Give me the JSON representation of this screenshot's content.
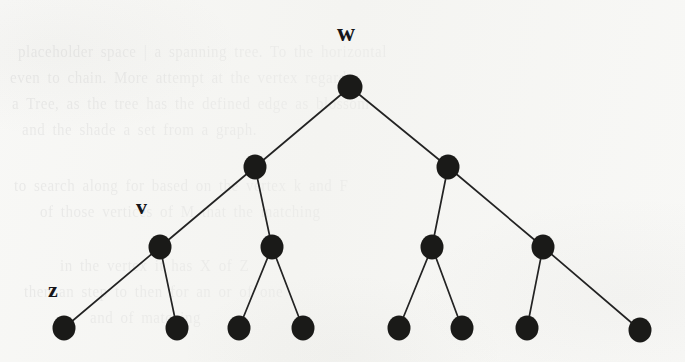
{
  "figure": {
    "kind": "binary-tree-diagram",
    "background_color": "#f8f8f6",
    "node_color": "#1a1a18",
    "edge_color": "#232323",
    "label_color": "#16161a",
    "width": 685,
    "height": 362
  },
  "labels": [
    {
      "id": "label-w",
      "text": "w",
      "x": 337,
      "y": 20,
      "font_size": 25,
      "anchor_node": "n-root"
    },
    {
      "id": "label-v",
      "text": "v",
      "x": 136,
      "y": 196,
      "font_size": 22,
      "anchor_node": "n-l-l"
    },
    {
      "id": "label-z",
      "text": "z",
      "x": 48,
      "y": 279,
      "font_size": 22,
      "anchor_node": "n-leaf-1"
    }
  ],
  "nodes": [
    {
      "id": "n-root",
      "label": "w",
      "level": 0,
      "cx": 350,
      "cy": 87,
      "rx": 12.5,
      "ry": 12.5
    },
    {
      "id": "n-l",
      "label": "",
      "level": 1,
      "cx": 255,
      "cy": 167,
      "rx": 11.5,
      "ry": 12.5
    },
    {
      "id": "n-r",
      "label": "",
      "level": 1,
      "cx": 448,
      "cy": 167,
      "rx": 11.5,
      "ry": 12.5
    },
    {
      "id": "n-l-l",
      "label": "v",
      "level": 2,
      "cx": 160,
      "cy": 247,
      "rx": 11.5,
      "ry": 12.5
    },
    {
      "id": "n-l-r",
      "label": "",
      "level": 2,
      "cx": 272,
      "cy": 247,
      "rx": 11.5,
      "ry": 12.5
    },
    {
      "id": "n-r-l",
      "label": "",
      "level": 2,
      "cx": 432,
      "cy": 247,
      "rx": 11.5,
      "ry": 12.5
    },
    {
      "id": "n-r-r",
      "label": "",
      "level": 2,
      "cx": 543,
      "cy": 247,
      "rx": 11.5,
      "ry": 12.5
    },
    {
      "id": "n-leaf-1",
      "label": "z",
      "level": 3,
      "cx": 64,
      "cy": 328,
      "rx": 11.5,
      "ry": 12.5
    },
    {
      "id": "n-leaf-2",
      "label": "",
      "level": 3,
      "cx": 177,
      "cy": 328,
      "rx": 11.5,
      "ry": 12.5
    },
    {
      "id": "n-leaf-3",
      "label": "",
      "level": 3,
      "cx": 239,
      "cy": 328,
      "rx": 11.5,
      "ry": 12.5
    },
    {
      "id": "n-leaf-4",
      "label": "",
      "level": 3,
      "cx": 303,
      "cy": 328,
      "rx": 11.5,
      "ry": 12.5
    },
    {
      "id": "n-leaf-5",
      "label": "",
      "level": 3,
      "cx": 399,
      "cy": 328,
      "rx": 11.5,
      "ry": 12.5
    },
    {
      "id": "n-leaf-6",
      "label": "",
      "level": 3,
      "cx": 462,
      "cy": 328,
      "rx": 11.5,
      "ry": 12.5
    },
    {
      "id": "n-leaf-7",
      "label": "",
      "level": 3,
      "cx": 527,
      "cy": 328,
      "rx": 11.5,
      "ry": 12.5
    },
    {
      "id": "n-leaf-8",
      "label": "",
      "level": 3,
      "cx": 640,
      "cy": 330,
      "rx": 11.5,
      "ry": 12.5
    }
  ],
  "edges": [
    {
      "id": "e-root-l",
      "from": "n-root",
      "to": "n-l"
    },
    {
      "id": "e-root-r",
      "from": "n-root",
      "to": "n-r"
    },
    {
      "id": "e-l-ll",
      "from": "n-l",
      "to": "n-l-l"
    },
    {
      "id": "e-l-lr",
      "from": "n-l",
      "to": "n-l-r"
    },
    {
      "id": "e-r-rl",
      "from": "n-r",
      "to": "n-r-l"
    },
    {
      "id": "e-r-rr",
      "from": "n-r",
      "to": "n-r-r"
    },
    {
      "id": "e-ll-leaf1",
      "from": "n-l-l",
      "to": "n-leaf-1"
    },
    {
      "id": "e-ll-leaf2",
      "from": "n-l-l",
      "to": "n-leaf-2"
    },
    {
      "id": "e-lr-leaf3",
      "from": "n-l-r",
      "to": "n-leaf-3"
    },
    {
      "id": "e-lr-leaf4",
      "from": "n-l-r",
      "to": "n-leaf-4"
    },
    {
      "id": "e-rl-leaf5",
      "from": "n-r-l",
      "to": "n-leaf-5"
    },
    {
      "id": "e-rl-leaf6",
      "from": "n-r-l",
      "to": "n-leaf-6"
    },
    {
      "id": "e-rr-leaf7",
      "from": "n-r-r",
      "to": "n-leaf-7"
    },
    {
      "id": "e-rr-leaf8",
      "from": "n-r-r",
      "to": "n-leaf-8"
    }
  ],
  "background_ghost_text": [
    {
      "text": "placeholder space | a spanning tree. To the horizontal",
      "x": 18,
      "y": 44,
      "size": 15
    },
    {
      "text": "even to chain. More attempt at the vertex regards",
      "x": 10,
      "y": 70,
      "size": 15
    },
    {
      "text": "a Tree, as the tree has the defined edge as blossom",
      "x": 12,
      "y": 96,
      "size": 15
    },
    {
      "text": "and the shade  a set from a graph.",
      "x": 22,
      "y": 122,
      "size": 15
    },
    {
      "text": "to search along for based on the vertex  k and F",
      "x": 14,
      "y": 178,
      "size": 15
    },
    {
      "text": "of those vertices of M that the matching",
      "x": 40,
      "y": 204,
      "size": 15
    },
    {
      "text": "in the  vertex it has   X of Z",
      "x": 60,
      "y": 258,
      "size": 15
    },
    {
      "text": "then an  step to then for  an  or  of  one",
      "x": 24,
      "y": 284,
      "size": 15
    },
    {
      "text": "and  of  matching",
      "x": 90,
      "y": 310,
      "size": 15
    }
  ]
}
